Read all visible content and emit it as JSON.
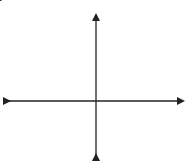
{
  "problem_label": "3.",
  "chart_data": {
    "type": "line",
    "title": "",
    "xlabel": "x",
    "ylabel": "y",
    "origin_label": "O",
    "xlim": [
      -5,
      5
    ],
    "ylim": [
      -3,
      5
    ],
    "grid": true,
    "x_ticks": [
      "-4",
      "-2",
      "2",
      "4"
    ],
    "y_ticks": [
      "4",
      "2",
      "-2"
    ],
    "series": [
      {
        "name": "line",
        "equation": "y = -3x + 4",
        "x": [
          -0.3,
          2.3
        ],
        "y": [
          4.9,
          -2.9
        ],
        "arrows": "both"
      }
    ],
    "intercepts": {
      "y_intercept": 4,
      "x_intercept": 1.33
    }
  }
}
